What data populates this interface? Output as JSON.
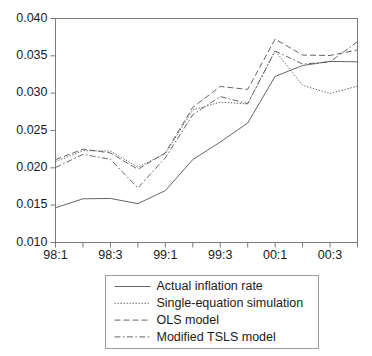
{
  "chart_data": {
    "type": "line",
    "title": "",
    "xlabel": "",
    "ylabel": "",
    "grid": false,
    "legend_position": "bottom",
    "x": [
      "98:1",
      "98:2",
      "98:3",
      "98:4",
      "99:1",
      "99:2",
      "99:3",
      "99:4",
      "00:1",
      "00:2",
      "00:3",
      "00:4"
    ],
    "categories": [
      "98:1",
      "98:2",
      "98:3",
      "98:4",
      "99:1",
      "99:2",
      "99:3",
      "99:4",
      "00:1",
      "00:2",
      "00:3",
      "00:4"
    ],
    "xtick_labels": [
      "98:1",
      "",
      "98:3",
      "",
      "99:1",
      "",
      "99:3",
      "",
      "00:1",
      "",
      "00:3",
      ""
    ],
    "xtick_labels_shown": [
      "98:1",
      "98:3",
      "99:1",
      "99:3",
      "00:1",
      "00:3"
    ],
    "ytick_labels": [
      "0.010",
      "0.015",
      "0.020",
      "0.025",
      "0.030",
      "0.035",
      "0.040"
    ],
    "yticks": [
      0.01,
      0.015,
      0.02,
      0.025,
      0.03,
      0.035,
      0.04
    ],
    "ylim": [
      0.01,
      0.04
    ],
    "series": [
      {
        "name": "Actual inflation rate",
        "style": "solid",
        "values": [
          0.01465,
          0.01585,
          0.0159,
          0.0152,
          0.01695,
          0.0211,
          0.02345,
          0.026,
          0.03225,
          0.0337,
          0.03425,
          0.0342
        ]
      },
      {
        "name": "Single-equation simulation",
        "style": "dotted",
        "values": [
          0.02085,
          0.0223,
          0.02225,
          0.0201,
          0.0219,
          0.02775,
          0.0288,
          0.02855,
          0.0357,
          0.03105,
          0.02995,
          0.03095
        ]
      },
      {
        "name": "OLS model",
        "style": "dashed",
        "values": [
          0.0211,
          0.0225,
          0.022,
          0.0198,
          0.022,
          0.0281,
          0.0309,
          0.0305,
          0.03725,
          0.0351,
          0.03505,
          0.0358
        ]
      },
      {
        "name": "Modified TSLS model",
        "style": "dashdot",
        "values": [
          0.02005,
          0.0218,
          0.02115,
          0.0173,
          0.02135,
          0.0271,
          0.02955,
          0.0286,
          0.03565,
          0.0339,
          0.0342,
          0.0369
        ]
      }
    ],
    "colors": {
      "line": "#555555",
      "axis": "#7a7a7a",
      "text": "#1a1a1a",
      "background": "#ffffff"
    }
  },
  "legend": {
    "items": [
      {
        "label": "Actual inflation rate",
        "style": "solid"
      },
      {
        "label": "Single-equation simulation",
        "style": "dotted"
      },
      {
        "label": "OLS model",
        "style": "dashed"
      },
      {
        "label": "Modified TSLS model",
        "style": "dashdot"
      }
    ]
  }
}
